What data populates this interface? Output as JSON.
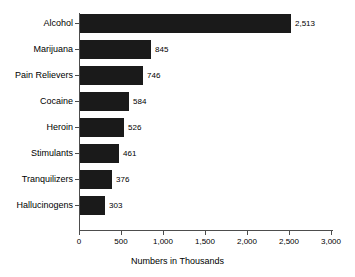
{
  "chart_data": {
    "type": "bar",
    "orientation": "horizontal",
    "title": "",
    "subtitle": "",
    "xlabel": "Numbers in Thousands",
    "ylabel": "",
    "categories": [
      "Alcohol",
      "Marijuana",
      "Pain Relievers",
      "Cocaine",
      "Heroin",
      "Stimulants",
      "Tranquilizers",
      "Hallucinogens"
    ],
    "values": [
      2513,
      845,
      746,
      584,
      526,
      461,
      376,
      303
    ],
    "data_labels": [
      "2,513",
      "845",
      "746",
      "584",
      "526",
      "461",
      "376",
      "303"
    ],
    "xlim": [
      0,
      3000
    ],
    "xticks": [
      0,
      500,
      1000,
      1500,
      2000,
      2500,
      3000
    ],
    "xtick_labels": [
      "0",
      "500",
      "1,000",
      "1,500",
      "2,000",
      "2,500",
      "3,000"
    ],
    "grid": false,
    "legend": null,
    "bar_color": "#1a1a1a",
    "axis_color": "#4d4d4d",
    "background_color": "#ffffff"
  }
}
